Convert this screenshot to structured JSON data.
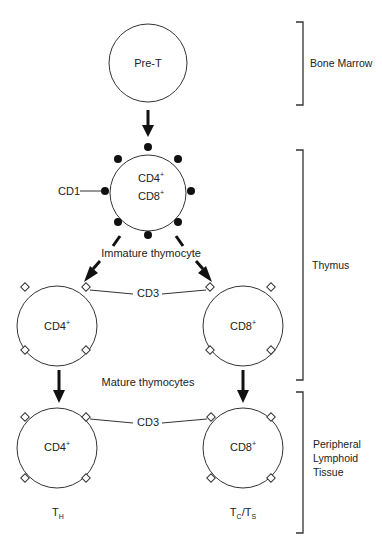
{
  "diagram": {
    "type": "T-cell development pathway",
    "colors": {
      "stroke": "#333333",
      "background": "#ffffff",
      "text": "#222222"
    },
    "nodes": {
      "pre_t": {
        "label": "Pre-T"
      },
      "immature": {
        "line1_base": "CD4",
        "line1_sup": "+",
        "line2_base": "CD8",
        "line2_sup": "+",
        "marker_label": "CD1",
        "caption": "Immature thymocyte"
      },
      "mature_cd4": {
        "base": "CD4",
        "sup": "+"
      },
      "mature_cd8": {
        "base": "CD8",
        "sup": "+"
      },
      "mature_marker": "CD3",
      "mature_caption": "Mature thymocytes",
      "periph_cd4": {
        "base": "CD4",
        "sup": "+",
        "type_base": "T",
        "type_sub": "H"
      },
      "periph_cd8": {
        "base": "CD8",
        "sup": "+",
        "type1_base": "T",
        "type1_sub": "C",
        "slash": "/",
        "type2_base": "T",
        "type2_sub": "S"
      },
      "periph_marker": "CD3"
    },
    "regions": [
      {
        "label": "Bone Marrow"
      },
      {
        "label": "Thymus"
      },
      {
        "label_lines": [
          "Peripheral",
          "Lymphoid",
          "Tissue"
        ]
      }
    ]
  }
}
